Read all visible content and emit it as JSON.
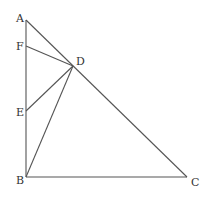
{
  "diagram": {
    "points": {
      "A": {
        "label": "A",
        "x": 26,
        "y": 20,
        "lx": 16,
        "ly": 22
      },
      "F": {
        "label": "F",
        "x": 26,
        "y": 46,
        "lx": 16,
        "ly": 50
      },
      "D": {
        "label": "D",
        "x": 73,
        "y": 66,
        "lx": 76,
        "ly": 65
      },
      "E": {
        "label": "E",
        "x": 26,
        "y": 111,
        "lx": 16,
        "ly": 116
      },
      "B": {
        "label": "B",
        "x": 26,
        "y": 177,
        "lx": 16,
        "ly": 184
      },
      "C": {
        "label": "C",
        "x": 187,
        "y": 177,
        "lx": 191,
        "ly": 186
      }
    },
    "segments": [
      [
        "A",
        "B"
      ],
      [
        "B",
        "C"
      ],
      [
        "A",
        "C"
      ],
      [
        "F",
        "D"
      ],
      [
        "E",
        "D"
      ],
      [
        "B",
        "D"
      ]
    ]
  }
}
